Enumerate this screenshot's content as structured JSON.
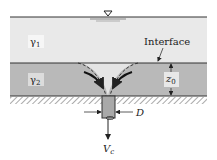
{
  "diagram": {
    "colors": {
      "background": "#ffffff",
      "upper_fluid": "#e9e9e9",
      "lower_fluid": "#b9b9b9",
      "drawdown_region": "#e4e4e4",
      "line": "#333333",
      "hatch": "#555555",
      "pipe_fill": "#a9a9a9"
    },
    "labels": {
      "upper_layer": {
        "symbol": "γ",
        "subscript": "1"
      },
      "lower_layer": {
        "symbol": "γ",
        "subscript": "2"
      },
      "interface": "Interface",
      "lower_depth": {
        "symbol": "z",
        "subscript": "0"
      },
      "pipe_diameter": "D",
      "outflow_velocity": {
        "symbol": "V",
        "subscript": "c"
      }
    },
    "icons": {
      "free_surface": "water-level-triangle-icon"
    }
  }
}
